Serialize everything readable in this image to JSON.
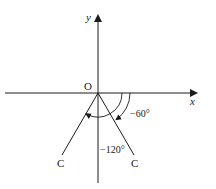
{
  "diagram": {
    "type": "angle-diagram",
    "axes": {
      "x_label": "x",
      "y_label": "y",
      "origin_label": "O"
    },
    "rays": [
      {
        "end_label": "C",
        "angle_deg": -60,
        "side": "right"
      },
      {
        "end_label": "C",
        "angle_deg": -120,
        "side": "left"
      }
    ],
    "angle_labels": {
      "minus_60": "−60°",
      "minus_120": "−120°"
    },
    "colors": {
      "line": "#1a1a1a",
      "background": "#ffffff"
    }
  }
}
